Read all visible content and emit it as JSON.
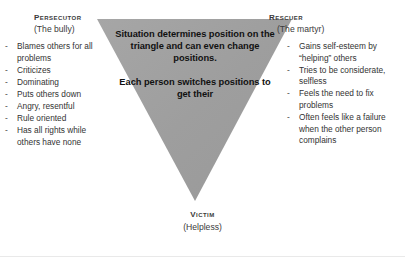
{
  "diagram": {
    "shape": {
      "name": "inverted-triangle",
      "fill_color": "#a0a0a0",
      "points": "97,19 292,19 195,201"
    },
    "background_color": "#ffffff"
  },
  "persecutor": {
    "title": "Persecutor",
    "subtitle": "(The bully)",
    "bullets": [
      "Blames others for all problems",
      "Criticizes",
      "Dominating",
      "Puts others down",
      "Angry, resentful",
      "Rule oriented",
      "Has all rights while others have none"
    ]
  },
  "rescuer": {
    "title": "Rescuer",
    "subtitle": "(The martyr)",
    "bullets": [
      "Gains self-esteem by “helping” others",
      "Tries to be considerate, selfless",
      "Feels the need to fix problems",
      "Often feels like a failure when the other person complains"
    ]
  },
  "victim": {
    "title": "Victim",
    "subtitle": "(Helpless)"
  },
  "center": {
    "paragraph_1": "Situation determines position on the triangle and can even change positions.",
    "paragraph_2": "Each person switches positions to get their"
  },
  "bullet_marker": "-"
}
